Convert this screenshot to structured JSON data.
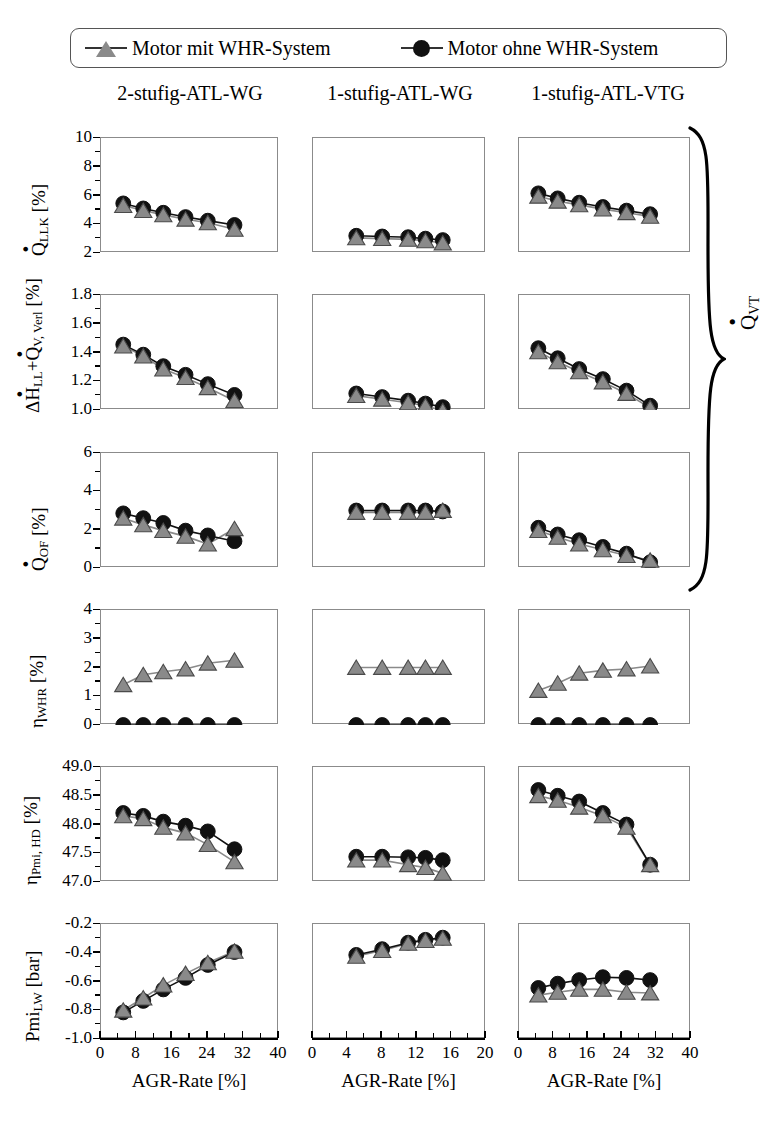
{
  "legend": {
    "items": [
      {
        "label": "Motor mit WHR-System",
        "marker": "triangle-marker",
        "color": "#8a8a8a"
      },
      {
        "label": "Motor ohne WHR-System",
        "marker": "circle-marker",
        "color": "#111111"
      }
    ]
  },
  "columns": [
    {
      "title": "2-stufig-ATL-WG"
    },
    {
      "title": "1-stufig-ATL-WG"
    },
    {
      "title": "1-stufig-ATL-VTG"
    }
  ],
  "group_brace": {
    "label": "Q̇VT",
    "rows": "1-3"
  },
  "xaxis_label": "AGR-Rate [%]",
  "series_names": {
    "tri": "Motor mit WHR-System",
    "cir": "Motor ohne WHR-System"
  },
  "rows": [
    {
      "ylabel_html": "Q̇LLK [%]",
      "ylim": [
        2,
        10
      ],
      "yticks": [
        "2",
        "4",
        "6",
        "8",
        "10"
      ]
    },
    {
      "ylabel_html": "ΔḢLL+Q̇V,Verl [%]",
      "ylim": [
        1.0,
        1.8
      ],
      "yticks": [
        "1.0",
        "1.2",
        "1.4",
        "1.6",
        "1.8"
      ]
    },
    {
      "ylabel_html": "Q̇OF [%]",
      "ylim": [
        0,
        6
      ],
      "yticks": [
        "0",
        "2",
        "4",
        "6"
      ]
    },
    {
      "ylabel_html": "ηWHR [%]",
      "ylim": [
        0,
        4
      ],
      "yticks": [
        "0",
        "1",
        "2",
        "3",
        "4"
      ]
    },
    {
      "ylabel_html": "ηPmi, HD [%]",
      "ylim": [
        47.0,
        49.0
      ],
      "yticks": [
        "47.0",
        "47.5",
        "48.0",
        "48.5",
        "49.0"
      ]
    },
    {
      "ylabel_html": "PmiLW [bar]",
      "ylim": [
        -1.0,
        -0.2
      ],
      "yticks": [
        "-1.0",
        "-0.8",
        "-0.6",
        "-0.4",
        "-0.2"
      ]
    }
  ],
  "chart_data": {
    "type": "line",
    "xlabel": "AGR-Rate [%]",
    "legend_position": "top",
    "grid": false,
    "panel_grid": "3 columns x 6 rows",
    "columns": [
      "2-stufig-ATL-WG",
      "1-stufig-ATL-WG",
      "1-stufig-ATL-VTG"
    ],
    "xlims": [
      [
        0,
        40
      ],
      [
        0,
        20
      ],
      [
        0,
        40
      ]
    ],
    "xticks": [
      [
        "0",
        "8",
        "16",
        "24",
        "32",
        "40"
      ],
      [
        "0",
        "4",
        "8",
        "12",
        "16",
        "20"
      ],
      [
        "0",
        "8",
        "16",
        "24",
        "32",
        "40"
      ]
    ],
    "panels": [
      {
        "row": 1,
        "ylabel": "Q̇LLK [%]",
        "ylim": [
          2,
          10
        ],
        "yticks": [
          2,
          4,
          6,
          8,
          10
        ],
        "cells": [
          {
            "column": "2-stufig-ATL-WG",
            "x": [
              5,
              9.5,
              14,
              19,
              24,
              30
            ],
            "series": [
              {
                "name": "Motor mit WHR-System",
                "values": [
                  5.3,
                  4.95,
                  4.65,
                  4.35,
                  4.1,
                  3.65
                ]
              },
              {
                "name": "Motor ohne WHR-System",
                "values": [
                  5.45,
                  5.1,
                  4.8,
                  4.5,
                  4.25,
                  3.95
                ]
              }
            ]
          },
          {
            "column": "1-stufig-ATL-WG",
            "x": [
              5,
              8,
              11,
              13,
              15
            ],
            "series": [
              {
                "name": "Motor mit WHR-System",
                "values": [
                  3.05,
                  3.0,
                  2.95,
                  2.85,
                  2.7
                ]
              },
              {
                "name": "Motor ohne WHR-System",
                "values": [
                  3.2,
                  3.15,
                  3.1,
                  3.0,
                  2.9
                ]
              }
            ]
          },
          {
            "column": "1-stufig-ATL-VTG",
            "x": [
              4.5,
              9,
              14,
              19.5,
              25,
              30.5
            ],
            "series": [
              {
                "name": "Motor mit WHR-System",
                "values": [
                  5.95,
                  5.6,
                  5.35,
                  5.05,
                  4.8,
                  4.55
                ]
              },
              {
                "name": "Motor ohne WHR-System",
                "values": [
                  6.15,
                  5.8,
                  5.5,
                  5.2,
                  4.95,
                  4.7
                ]
              }
            ]
          }
        ]
      },
      {
        "row": 2,
        "ylabel": "ΔḢLL+Q̇V,Verl [%]",
        "ylim": [
          1.0,
          1.8
        ],
        "yticks": [
          1.0,
          1.2,
          1.4,
          1.6,
          1.8
        ],
        "cells": [
          {
            "column": "2-stufig-ATL-WG",
            "x": [
              5,
              9.5,
              14,
              19,
              24,
              30
            ],
            "series": [
              {
                "name": "Motor mit WHR-System",
                "values": [
                  1.445,
                  1.375,
                  1.285,
                  1.225,
                  1.155,
                  1.065
                ]
              },
              {
                "name": "Motor ohne WHR-System",
                "values": [
                  1.455,
                  1.385,
                  1.305,
                  1.245,
                  1.18,
                  1.105
                ]
              }
            ]
          },
          {
            "column": "1-stufig-ATL-WG",
            "x": [
              5,
              8,
              11,
              13,
              15
            ],
            "series": [
              {
                "name": "Motor mit WHR-System",
                "values": [
                  1.1,
                  1.075,
                  1.05,
                  1.03,
                  0.995
                ]
              },
              {
                "name": "Motor ohne WHR-System",
                "values": [
                  1.115,
                  1.09,
                  1.065,
                  1.045,
                  1.02
                ]
              }
            ]
          },
          {
            "column": "1-stufig-ATL-VTG",
            "x": [
              4.5,
              9,
              14,
              19.5,
              25,
              30.5
            ],
            "series": [
              {
                "name": "Motor mit WHR-System",
                "values": [
                  1.405,
                  1.335,
                  1.265,
                  1.195,
                  1.115,
                  1.015
                ]
              },
              {
                "name": "Motor ohne WHR-System",
                "values": [
                  1.43,
                  1.36,
                  1.285,
                  1.215,
                  1.135,
                  1.03
                ]
              }
            ]
          }
        ]
      },
      {
        "row": 3,
        "ylabel": "Q̇OF [%]",
        "ylim": [
          0,
          6
        ],
        "yticks": [
          0,
          2,
          4,
          6
        ],
        "cells": [
          {
            "column": "2-stufig-ATL-WG",
            "x": [
              5,
              9.5,
              14,
              19,
              24,
              30
            ],
            "series": [
              {
                "name": "Motor mit WHR-System",
                "values": [
                  2.6,
                  2.25,
                  1.95,
                  1.65,
                  1.25,
                  2.05
                ]
              },
              {
                "name": "Motor ohne WHR-System",
                "values": [
                  2.85,
                  2.6,
                  2.35,
                  1.95,
                  1.7,
                  1.4
                ]
              }
            ]
          },
          {
            "column": "1-stufig-ATL-WG",
            "x": [
              5,
              8,
              11,
              13,
              15
            ],
            "series": [
              {
                "name": "Motor mit WHR-System",
                "values": [
                  2.9,
                  2.9,
                  2.9,
                  2.9,
                  3.0
                ]
              },
              {
                "name": "Motor ohne WHR-System",
                "values": [
                  3.0,
                  3.0,
                  3.0,
                  3.0,
                  2.95
                ]
              }
            ]
          },
          {
            "column": "1-stufig-ATL-VTG",
            "x": [
              4.5,
              9,
              14,
              19.5,
              25,
              30.5
            ],
            "series": [
              {
                "name": "Motor mit WHR-System",
                "values": [
                  1.95,
                  1.6,
                  1.25,
                  0.95,
                  0.65,
                  0.4
                ]
              },
              {
                "name": "Motor ohne WHR-System",
                "values": [
                  2.1,
                  1.75,
                  1.45,
                  1.1,
                  0.75,
                  0.3
                ]
              }
            ]
          }
        ]
      },
      {
        "row": 4,
        "ylabel": "ηWHR [%]",
        "ylim": [
          0,
          4
        ],
        "yticks": [
          0,
          1,
          2,
          3,
          4
        ],
        "cells": [
          {
            "column": "2-stufig-ATL-WG",
            "x": [
              5,
              9.5,
              14,
              19,
              24,
              30
            ],
            "series": [
              {
                "name": "Motor mit WHR-System",
                "values": [
                  1.4,
                  1.75,
                  1.85,
                  1.95,
                  2.15,
                  2.25
                ]
              },
              {
                "name": "Motor ohne WHR-System",
                "values": [
                  0,
                  0,
                  0,
                  0,
                  0,
                  0
                ]
              }
            ]
          },
          {
            "column": "1-stufig-ATL-WG",
            "x": [
              5,
              8,
              11,
              13,
              15
            ],
            "series": [
              {
                "name": "Motor mit WHR-System",
                "values": [
                  2.0,
                  2.0,
                  2.0,
                  2.0,
                  2.0
                ]
              },
              {
                "name": "Motor ohne WHR-System",
                "values": [
                  0,
                  0,
                  0,
                  0,
                  0
                ]
              }
            ]
          },
          {
            "column": "1-stufig-ATL-VTG",
            "x": [
              4.5,
              9,
              14,
              19.5,
              25,
              30.5
            ],
            "series": [
              {
                "name": "Motor mit WHR-System",
                "values": [
                  1.2,
                  1.45,
                  1.8,
                  1.9,
                  1.95,
                  2.05
                ]
              },
              {
                "name": "Motor ohne WHR-System",
                "values": [
                  0,
                  0,
                  0,
                  0,
                  0,
                  0
                ]
              }
            ]
          }
        ]
      },
      {
        "row": 5,
        "ylabel": "ηPmi, HD [%]",
        "ylim": [
          47.0,
          49.0
        ],
        "yticks": [
          47.0,
          47.5,
          48.0,
          48.5,
          49.0
        ],
        "cells": [
          {
            "column": "2-stufig-ATL-WG",
            "x": [
              5,
              9.5,
              14,
              19,
              24,
              30
            ],
            "series": [
              {
                "name": "Motor mit WHR-System",
                "values": [
                  48.15,
                  48.1,
                  47.95,
                  47.85,
                  47.65,
                  47.35
                ]
              },
              {
                "name": "Motor ohne WHR-System",
                "values": [
                  48.2,
                  48.15,
                  48.05,
                  47.98,
                  47.88,
                  47.57
                ]
              }
            ]
          },
          {
            "column": "1-stufig-ATL-WG",
            "x": [
              5,
              8,
              11,
              13,
              15
            ],
            "series": [
              {
                "name": "Motor mit WHR-System",
                "values": [
                  47.38,
                  47.38,
                  47.3,
                  47.25,
                  47.15
                ]
              },
              {
                "name": "Motor ohne WHR-System",
                "values": [
                  47.44,
                  47.44,
                  47.43,
                  47.42,
                  47.38
                ]
              }
            ]
          },
          {
            "column": "1-stufig-ATL-VTG",
            "x": [
              4.5,
              9,
              14,
              19.5,
              25,
              30.5
            ],
            "series": [
              {
                "name": "Motor mit WHR-System",
                "values": [
                  48.5,
                  48.42,
                  48.3,
                  48.15,
                  47.95,
                  47.3
                ]
              },
              {
                "name": "Motor ohne WHR-System",
                "values": [
                  48.6,
                  48.5,
                  48.4,
                  48.2,
                  48.0,
                  47.3
                ]
              }
            ]
          }
        ]
      },
      {
        "row": 6,
        "ylabel": "PmiLW [bar]",
        "ylim": [
          -1.0,
          -0.2
        ],
        "yticks": [
          -1.0,
          -0.8,
          -0.6,
          -0.4,
          -0.2
        ],
        "cells": [
          {
            "column": "2-stufig-ATL-WG",
            "x": [
              5,
              9.5,
              14,
              19,
              24,
              30
            ],
            "series": [
              {
                "name": "Motor mit WHR-System",
                "values": [
                  -0.8,
                  -0.715,
                  -0.625,
                  -0.545,
                  -0.47,
                  -0.39
                ]
              },
              {
                "name": "Motor ohne WHR-System",
                "values": [
                  -0.815,
                  -0.735,
                  -0.655,
                  -0.575,
                  -0.485,
                  -0.395
                ]
              }
            ]
          },
          {
            "column": "1-stufig-ATL-WG",
            "x": [
              5,
              8,
              11,
              13,
              15
            ],
            "series": [
              {
                "name": "Motor mit WHR-System",
                "values": [
                  -0.425,
                  -0.385,
                  -0.335,
                  -0.315,
                  -0.3
                ]
              },
              {
                "name": "Motor ohne WHR-System",
                "values": [
                  -0.415,
                  -0.375,
                  -0.33,
                  -0.31,
                  -0.295
                ]
              }
            ]
          },
          {
            "column": "1-stufig-ATL-VTG",
            "x": [
              4.5,
              9,
              14,
              19.5,
              25,
              30.5
            ],
            "series": [
              {
                "name": "Motor mit WHR-System",
                "values": [
                  -0.695,
                  -0.675,
                  -0.655,
                  -0.655,
                  -0.675,
                  -0.68
                ]
              },
              {
                "name": "Motor ohne WHR-System",
                "values": [
                  -0.645,
                  -0.615,
                  -0.59,
                  -0.57,
                  -0.575,
                  -0.59
                ]
              }
            ]
          }
        ]
      }
    ]
  }
}
